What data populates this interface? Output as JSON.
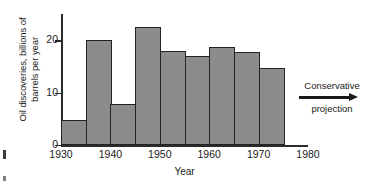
{
  "chart_data": {
    "type": "bar",
    "title": "",
    "xlabel": "Year",
    "ylabel": "Oil discoveries, billions of barrels per year",
    "ylabel_lines": [
      "Oil discoveries, billions of",
      "barrels per year"
    ],
    "xlim": [
      1930,
      1980
    ],
    "ylim": [
      0,
      25
    ],
    "grid": false,
    "legend": "none",
    "y_ticks": [
      0,
      10,
      20
    ],
    "y_tick_labels": [
      "0",
      "10",
      "20"
    ],
    "x_ticks": [
      1930,
      1940,
      1950,
      1960,
      1970,
      1980
    ],
    "x_tick_labels": [
      "1930",
      "1940",
      "1950",
      "1960",
      "1970",
      "1980"
    ],
    "bar_width_years": 5,
    "categories": [
      "1930-1935",
      "1935-1940",
      "1940-1945",
      "1945-1950",
      "1950-1955",
      "1955-1960",
      "1960-1965",
      "1965-1970",
      "1970-1975"
    ],
    "x_starts": [
      1930,
      1935,
      1940,
      1945,
      1950,
      1955,
      1960,
      1965,
      1970
    ],
    "values": [
      4.8,
      20.0,
      7.9,
      22.6,
      18.0,
      17.0,
      18.8,
      17.8,
      14.7
    ],
    "bar_fill_color": "#8c8c8c",
    "bar_edge_color": "#232323",
    "axis_color": "#2b2b2b"
  },
  "annotation": {
    "line1": "Conservative",
    "line2": "projection",
    "arrow_direction": "right"
  }
}
